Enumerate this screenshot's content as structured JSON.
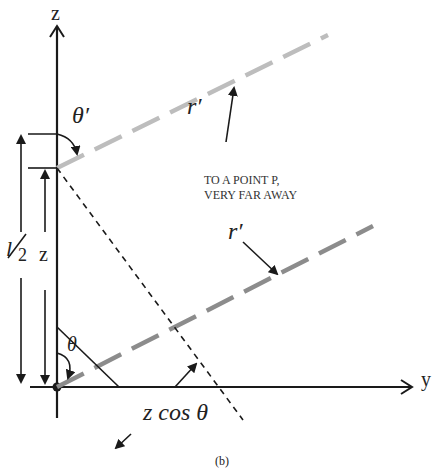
{
  "figure": {
    "caption": "(b)",
    "axes": {
      "z_label": "z",
      "y_label": "y"
    },
    "labels": {
      "theta_prime": "θ′",
      "theta": "θ",
      "r_prime_upper": "r′",
      "r_prime_lower": "r′",
      "half_length_num": "l",
      "half_length_den": "2",
      "z_offset": "z",
      "projection": "z cos θ",
      "annotation_line1": "TO A POINT P,",
      "annotation_line2": "VERY FAR AWAY"
    },
    "colors": {
      "axis": "#1a1a1a",
      "ray_upper": "#bdbdbd",
      "ray_lower": "#8c8c8c",
      "construction": "#1a1a1a",
      "background": "#ffffff"
    }
  }
}
